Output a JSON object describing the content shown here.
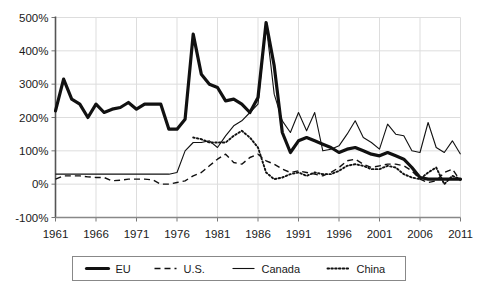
{
  "chart_data": {
    "type": "line",
    "title": "",
    "subtitle": "",
    "xlabel": "",
    "ylabel": "",
    "xlim": [
      1961,
      2011
    ],
    "ylim": [
      -100,
      500
    ],
    "grid": true,
    "legend_position": "bottom",
    "y_tick_labels": [
      "500%",
      "400%",
      "300%",
      "200%",
      "100%",
      "0%",
      "-100%"
    ],
    "y_ticks": [
      500,
      400,
      300,
      200,
      100,
      0,
      -100
    ],
    "x_tick_labels": [
      "1961",
      "1966",
      "1971",
      "1976",
      "1981",
      "1986",
      "1991",
      "1996",
      "2001",
      "2006",
      "2011"
    ],
    "x_ticks": [
      1961,
      1966,
      1971,
      1976,
      1981,
      1986,
      1991,
      1996,
      2001,
      2006,
      2011
    ],
    "x": [
      1961,
      1962,
      1963,
      1964,
      1965,
      1966,
      1967,
      1968,
      1969,
      1970,
      1971,
      1972,
      1973,
      1974,
      1975,
      1976,
      1977,
      1978,
      1979,
      1980,
      1981,
      1982,
      1983,
      1984,
      1985,
      1986,
      1987,
      1988,
      1989,
      1990,
      1991,
      1992,
      1993,
      1994,
      1995,
      1996,
      1997,
      1998,
      1999,
      2000,
      2001,
      2002,
      2003,
      2004,
      2005,
      2006,
      2007,
      2008,
      2009,
      2010,
      2011
    ],
    "series": [
      {
        "name": "EU",
        "style": "thick-solid",
        "color": "#111111",
        "values": [
          220,
          315,
          255,
          240,
          200,
          240,
          215,
          225,
          230,
          245,
          225,
          240,
          240,
          240,
          165,
          165,
          195,
          450,
          330,
          300,
          290,
          250,
          255,
          240,
          215,
          260,
          485,
          355,
          155,
          95,
          130,
          140,
          130,
          120,
          110,
          95,
          105,
          110,
          100,
          90,
          85,
          95,
          85,
          75,
          50,
          20,
          15,
          15,
          15,
          15,
          15
        ]
      },
      {
        "name": "U.S.",
        "style": "dashed",
        "color": "#111111",
        "values": [
          15,
          25,
          25,
          25,
          22,
          20,
          20,
          10,
          12,
          15,
          15,
          15,
          13,
          0,
          0,
          5,
          10,
          25,
          35,
          55,
          75,
          90,
          65,
          60,
          80,
          90,
          70,
          60,
          45,
          35,
          40,
          35,
          30,
          25,
          35,
          50,
          70,
          75,
          60,
          50,
          55,
          60,
          60,
          55,
          40,
          15,
          5,
          10,
          35,
          45,
          10
        ]
      },
      {
        "name": "Canada",
        "style": "thin-solid",
        "color": "#111111",
        "values": [
          30,
          30,
          30,
          30,
          30,
          30,
          30,
          30,
          30,
          30,
          30,
          30,
          30,
          30,
          30,
          35,
          100,
          125,
          125,
          130,
          110,
          145,
          175,
          190,
          215,
          240,
          480,
          270,
          190,
          155,
          215,
          160,
          215,
          100,
          105,
          115,
          150,
          190,
          140,
          125,
          105,
          180,
          150,
          145,
          100,
          95,
          185,
          110,
          95,
          130,
          90
        ]
      },
      {
        "name": "China",
        "style": "dotted",
        "color": "#111111",
        "values": [
          null,
          null,
          null,
          null,
          null,
          null,
          null,
          null,
          null,
          null,
          null,
          null,
          null,
          null,
          null,
          null,
          null,
          140,
          135,
          125,
          125,
          125,
          145,
          160,
          140,
          110,
          35,
          15,
          20,
          30,
          35,
          25,
          35,
          30,
          30,
          40,
          55,
          60,
          55,
          45,
          45,
          55,
          50,
          30,
          20,
          15,
          35,
          50,
          0,
          25,
          15
        ]
      }
    ]
  },
  "legend": {
    "entries": [
      {
        "label": "EU",
        "style": "thick-solid"
      },
      {
        "label": "U.S.",
        "style": "dashed"
      },
      {
        "label": "Canada",
        "style": "thin-solid"
      },
      {
        "label": "China",
        "style": "dotted"
      }
    ]
  },
  "colors": {
    "ink": "#111111",
    "grid": "#dddddd",
    "axis": "#777777",
    "legend_border": "#888888",
    "background": "#ffffff"
  }
}
